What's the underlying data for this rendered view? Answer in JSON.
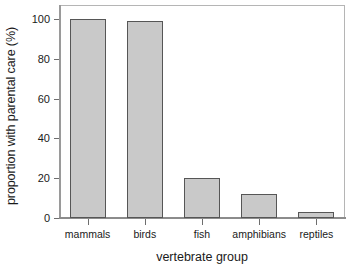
{
  "chart_data": {
    "type": "bar",
    "title": "",
    "subtitle": "",
    "categories": [
      "mammals",
      "birds",
      "fish",
      "amphibians",
      "reptiles"
    ],
    "values": [
      100,
      99,
      20,
      12,
      3
    ],
    "xlabel": "vertebrate group",
    "ylabel": "proportion with parental care (%)",
    "ylim": [
      0,
      107
    ],
    "yticks": [
      0,
      20,
      40,
      60,
      80,
      100
    ],
    "ytick_labels": [
      "0",
      "20",
      "40",
      "60",
      "80",
      "100"
    ],
    "grid": false,
    "legend": false,
    "legend_position": "none",
    "bar_fill_color": "#c9c9c9",
    "bar_edge_color": "#565656",
    "axis_color": "#8c8c8c",
    "background_color": "#ffffff",
    "text_color": "#1a1a1a"
  }
}
